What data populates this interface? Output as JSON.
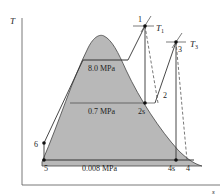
{
  "diagram": {
    "type": "T-s diagram (reheat Rankine cycle)",
    "axes": {
      "y_label": "T",
      "x_label": "s"
    },
    "pressure_lines": [
      {
        "label": "8.0 MPa"
      },
      {
        "label": "0.7 MPa"
      },
      {
        "label": "0.008 MPa"
      }
    ],
    "points": [
      {
        "id": "1",
        "label": "1"
      },
      {
        "id": "2",
        "label": "2"
      },
      {
        "id": "2s",
        "label": "2s"
      },
      {
        "id": "3",
        "label": "3"
      },
      {
        "id": "4",
        "label": "4"
      },
      {
        "id": "4s",
        "label": "4s"
      },
      {
        "id": "5",
        "label": "5"
      },
      {
        "id": "6",
        "label": "6"
      }
    ],
    "isotherms": [
      {
        "label_main": "T",
        "label_sub": "1"
      },
      {
        "label_main": "T",
        "label_sub": "3"
      }
    ],
    "colors": {
      "dome_fill": "#b8b8b8",
      "line": "#333333",
      "axis": "#555555",
      "background": "#ffffff"
    }
  }
}
